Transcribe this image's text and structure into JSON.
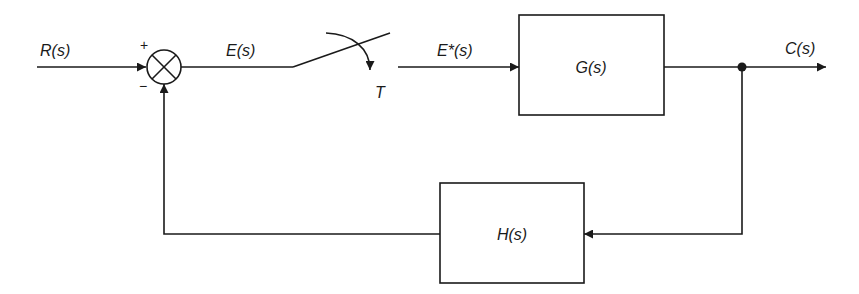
{
  "diagram": {
    "type": "sampled-data feedback control block diagram",
    "signals": {
      "input": "R(s)",
      "error": "E(s)",
      "sampled_error": "E*(s)",
      "output": "C(s)"
    },
    "sampler": {
      "label": "T"
    },
    "summing_junction": {
      "plus_sign": "+",
      "minus_sign": "−"
    },
    "blocks": {
      "forward": {
        "label": "G(s)"
      },
      "feedback": {
        "label": "H(s)"
      }
    },
    "colors": {
      "line": "#1a1a1a",
      "background": "#ffffff"
    }
  }
}
